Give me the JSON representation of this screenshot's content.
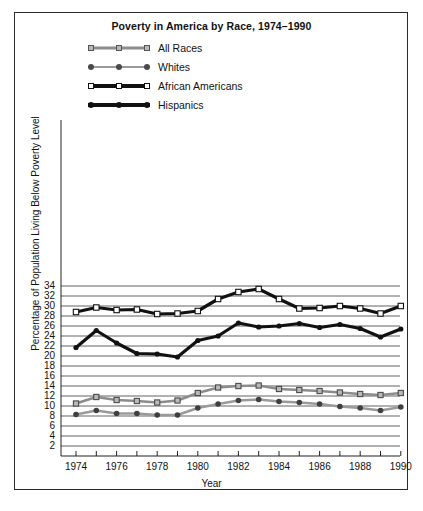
{
  "figure": {
    "title": "Poverty in America by Race, 1974–1990"
  },
  "legend": {
    "position": "top-left-under-title",
    "items": [
      {
        "label": "All Races",
        "marker": "open-square-gray",
        "color": "#8c8c8c",
        "line": "medium"
      },
      {
        "label": "Whites",
        "marker": "filled-circle-gray",
        "color": "#9a9a9a",
        "line": "thin"
      },
      {
        "label": "African Americans",
        "marker": "open-square-black",
        "color": "#111111",
        "line": "thick"
      },
      {
        "label": "Hispanics",
        "marker": "filled-circle-black",
        "color": "#111111",
        "line": "thick"
      }
    ]
  },
  "axes": {
    "ylabel": "Percentage of Population Living Below Poverty Level",
    "xlabel": "Year",
    "yticks": [
      2,
      4,
      6,
      8,
      10,
      12,
      14,
      16,
      18,
      20,
      22,
      24,
      26,
      28,
      30,
      32,
      34
    ],
    "xticks_labeled": [
      1974,
      1976,
      1978,
      1980,
      1982,
      1984,
      1986,
      1988,
      1990
    ]
  },
  "chart_data": {
    "type": "line",
    "title": "Poverty in America by Race, 1974–1990",
    "xlabel": "Year",
    "ylabel": "Percentage of Population Living Below Poverty Level",
    "xlim": [
      1973.4,
      1990.8
    ],
    "ylim": [
      1.0,
      35.0
    ],
    "grid": true,
    "legend_position": "top-left",
    "x": [
      1974,
      1975,
      1976,
      1977,
      1978,
      1979,
      1980,
      1981,
      1982,
      1983,
      1984,
      1985,
      1986,
      1987,
      1988,
      1989,
      1990
    ],
    "series": [
      {
        "name": "All Races",
        "color": "#8c8c8c",
        "marker": "open-square",
        "values": [
          10.5,
          11.8,
          11.2,
          11.0,
          10.7,
          11.1,
          12.6,
          13.7,
          14.0,
          14.1,
          13.4,
          13.2,
          13.0,
          12.7,
          12.4,
          12.2,
          12.6
        ]
      },
      {
        "name": "Whites",
        "color": "#9a9a9a",
        "marker": "filled-circle",
        "values": [
          8.3,
          9.1,
          8.5,
          8.5,
          8.2,
          8.2,
          9.6,
          10.4,
          11.1,
          11.3,
          10.9,
          10.7,
          10.4,
          9.9,
          9.6,
          9.1,
          9.8
        ]
      },
      {
        "name": "African Americans",
        "color": "#111111",
        "marker": "open-square",
        "values": [
          28.8,
          29.7,
          29.2,
          29.3,
          28.4,
          28.5,
          29.0,
          31.4,
          32.8,
          33.4,
          31.4,
          29.5,
          29.6,
          30.0,
          29.5,
          28.5,
          30.0
        ]
      },
      {
        "name": "Hispanics",
        "color": "#111111",
        "marker": "filled-circle",
        "values": [
          21.7,
          25.1,
          22.6,
          20.5,
          20.4,
          19.8,
          23.1,
          24.0,
          26.6,
          25.8,
          26.0,
          26.5,
          25.7,
          26.3,
          25.5,
          23.8,
          25.4
        ]
      }
    ]
  }
}
